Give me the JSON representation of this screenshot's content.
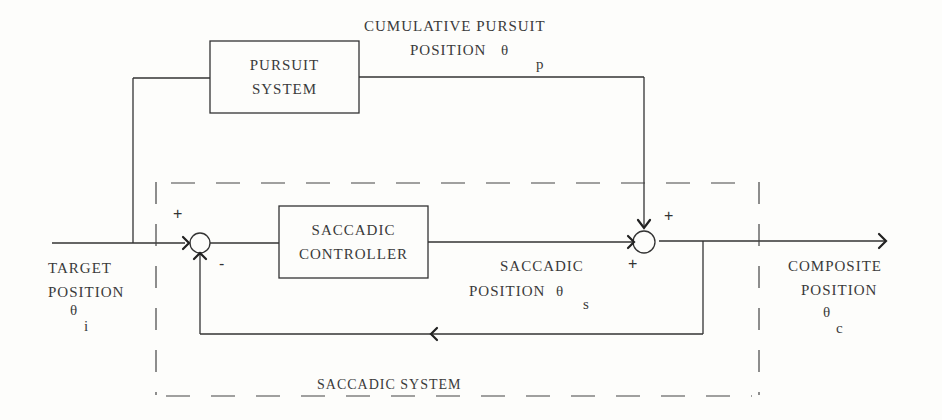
{
  "diagram": {
    "blocks": {
      "pursuit_system": {
        "line1": "PURSUIT",
        "line2": "SYSTEM"
      },
      "saccadic_controller": {
        "line1": "SACCADIC",
        "line2": "CONTROLLER"
      }
    },
    "signals": {
      "cumulative_pursuit": {
        "line1": "CUMULATIVE PURSUIT",
        "line2": "POSITION",
        "symbol": "θ",
        "subscript": "p"
      },
      "target_position": {
        "line1": "TARGET",
        "line2": "POSITION",
        "symbol": "θ",
        "subscript": "i"
      },
      "saccadic_position": {
        "line1": "SACCADIC",
        "line2": "POSITION",
        "symbol": "θ",
        "subscript": "s"
      },
      "composite_position": {
        "line1": "COMPOSITE",
        "line2": "POSITION",
        "symbol": "θ",
        "subscript": "c"
      }
    },
    "summing_junctions": {
      "left": {
        "top_sign": "+",
        "bottom_sign": "-"
      },
      "right": {
        "top_sign": "+",
        "bottom_sign": "+"
      }
    },
    "group_label": "SACCADIC SYSTEM",
    "colors": {
      "line": "#333333",
      "background": "#fdfdfb"
    }
  }
}
